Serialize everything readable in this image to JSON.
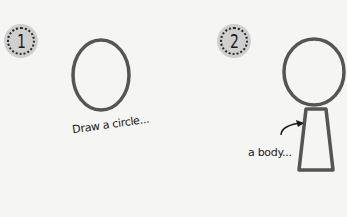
{
  "steps": [
    {
      "number": "1",
      "caption": "Draw a circle...",
      "figure": "circle-head"
    },
    {
      "number": "2",
      "caption": "a body...",
      "figure": "circle-head-with-trapezoid-body"
    }
  ],
  "colors": {
    "background": "#f5f5f3",
    "stroke": "#555555",
    "badge_fill": "#cfcfcf",
    "badge_dots": "#2a2a2a",
    "text": "#1a1a1a"
  }
}
